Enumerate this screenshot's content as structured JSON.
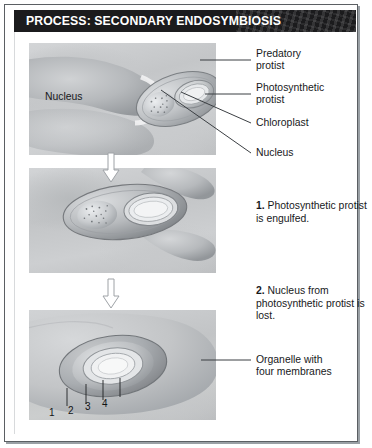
{
  "figure": {
    "header": {
      "title": "PROCESS: SECONDARY ENDOSYMBIOSIS",
      "bar_color": "#1b1b1d",
      "text_color": "#ffffff"
    },
    "frame_color": "#5b5f63",
    "background": "#ffffff"
  },
  "panels": [
    {
      "id": "panel-1",
      "caption": "",
      "inline_labels": [
        {
          "name": "nucleus-inline-label",
          "text": "Nucleus"
        }
      ],
      "callouts": [
        {
          "name": "callout-predatory-protist",
          "text": "Predatory\nprotist"
        },
        {
          "name": "callout-photosynthetic-protist",
          "text": "Photosynthetic\nprotist"
        },
        {
          "name": "callout-chloroplast",
          "text": "Chloroplast"
        },
        {
          "name": "callout-nucleus",
          "text": "Nucleus"
        }
      ]
    },
    {
      "id": "panel-2",
      "step_number": "1.",
      "step_text": "Photosynthetic protist is engulfed.",
      "callouts": []
    },
    {
      "id": "panel-3",
      "step_number": "2.",
      "step_text": "Nucleus from photosynthetic protist is lost.",
      "callouts": [
        {
          "name": "callout-organelle",
          "text": "Organelle with\nfour membranes"
        }
      ],
      "membrane_ticks": [
        "1",
        "2",
        "3",
        "4"
      ]
    }
  ],
  "arrows": [
    {
      "name": "process-arrow-1",
      "direction": "down",
      "icon": "arrow-down-icon"
    },
    {
      "name": "process-arrow-2",
      "direction": "down",
      "icon": "arrow-down-icon"
    }
  ],
  "colors": {
    "cell_light": "#d3d5d7",
    "cell_mid": "#c4c6c8",
    "cell_dark": "#9b9ea1",
    "outline": "#6d7175",
    "leader_line": "#3b3f43",
    "text": "#17191b"
  }
}
